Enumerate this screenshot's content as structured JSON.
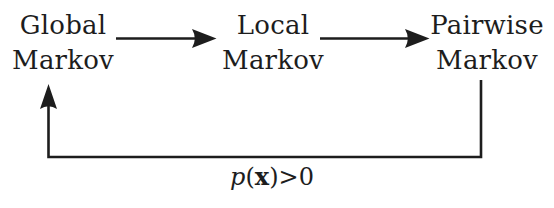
{
  "diagram": {
    "background_color": "#ffffff",
    "stroke_color": "#1d1d1d",
    "text_color": "#1d1d1d",
    "nodes": [
      {
        "id": "global",
        "line1": "Global",
        "line2": "Markov"
      },
      {
        "id": "local",
        "line1": "Local",
        "line2": "Markov"
      },
      {
        "id": "pairwise",
        "line1": "Pairwise",
        "line2": "Markov"
      }
    ],
    "edges": [
      {
        "id": "global-to-local",
        "from": "global",
        "to": "local",
        "label": ""
      },
      {
        "id": "local-to-pairwise",
        "from": "local",
        "to": "pairwise",
        "label": ""
      },
      {
        "id": "pairwise-to-global",
        "from": "pairwise",
        "to": "global",
        "label": "p(x)>0"
      }
    ],
    "loop_label": {
      "p": "p",
      "open_paren": "(",
      "vector": "x",
      "close_paren": ")",
      "relation": ">",
      "value": "0"
    }
  }
}
